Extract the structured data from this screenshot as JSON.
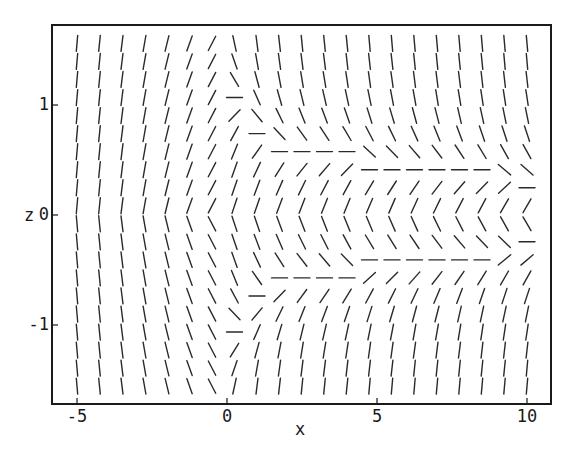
{
  "chart_data": {
    "type": "vector-field",
    "subtype": "director-field (headless line segments)",
    "title": "",
    "xlabel": "x",
    "ylabel": "z",
    "xlim": [
      -5.8,
      10.8
    ],
    "ylim": [
      -1.72,
      1.72
    ],
    "grid": false,
    "legend": null,
    "x_ticks": [
      {
        "value": -5,
        "label": "-5"
      },
      {
        "value": 0,
        "label": "0"
      },
      {
        "value": 5,
        "label": "5"
      },
      {
        "value": 10,
        "label": "10"
      }
    ],
    "y_ticks": [
      {
        "value": 1,
        "label": "1"
      },
      {
        "value": 0,
        "label": "0"
      },
      {
        "value": -1,
        "label": "-1"
      }
    ],
    "sampling": {
      "x_start": -5,
      "x_step": 0.75,
      "x_count": 21,
      "z_start": 1.56,
      "z_step": 0.164,
      "z_count": 20,
      "segment_length_px": 16
    },
    "defect_curve": {
      "description": "Horizontal-director wall, mirror symmetric about z=0; exists for x >= 0",
      "points_upper": [
        [
          0,
          1.1
        ],
        [
          0.75,
          0.8
        ],
        [
          1.5,
          0.64
        ],
        [
          2.25,
          0.56
        ],
        [
          3.0,
          0.54
        ],
        [
          3.75,
          0.52
        ],
        [
          4.5,
          0.48
        ],
        [
          5.25,
          0.46
        ],
        [
          6.0,
          0.44
        ],
        [
          6.75,
          0.41
        ],
        [
          7.5,
          0.38
        ],
        [
          8.25,
          0.35
        ],
        [
          9.0,
          0.33
        ],
        [
          9.75,
          0.32
        ],
        [
          10.0,
          0.32
        ]
      ]
    },
    "director_regions": [
      {
        "region": "x < 0",
        "orientation": "near vertical, leaning '/' increasing toward x=0 (≈5° at x=-5, ≈30° at x=-0.5)"
      },
      {
        "region": "x >= 0, |z| > defect",
        "orientation": "'\\' tilt, strongest near defect, relaxing to vertical far from it"
      },
      {
        "region": "x >= 0, |z| < defect",
        "orientation": "'/' tilt ≈ 20°, mirrored about z=0"
      }
    ]
  },
  "frame": {
    "stroke": "#1a1a1a",
    "segment_color": "#2a2a2a"
  }
}
